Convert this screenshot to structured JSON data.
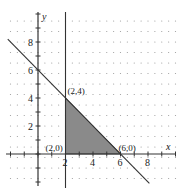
{
  "diagram": {
    "type": "feasible-region",
    "axes": {
      "x_label": "x",
      "y_label": "y",
      "x_ticks": [
        "2",
        "4",
        "6",
        "8"
      ],
      "y_ticks": [
        "2",
        "4",
        "6",
        "8"
      ]
    },
    "lines": [
      {
        "name": "x + y = 6",
        "from": [
          -2,
          8
        ],
        "to": [
          8,
          -2
        ]
      },
      {
        "name": "x = 2",
        "from": [
          2,
          -3
        ],
        "to": [
          2,
          10
        ]
      }
    ],
    "region": {
      "vertices": [
        [
          2,
          0
        ],
        [
          2,
          4
        ],
        [
          6,
          0
        ]
      ],
      "fill": "#8a8a8a"
    },
    "points": [
      {
        "label": "(2,4)",
        "x": 2,
        "y": 4
      },
      {
        "label": "(2,0)",
        "x": 2,
        "y": 0
      },
      {
        "label": "(6,0)",
        "x": 6,
        "y": 0
      }
    ],
    "colors": {
      "axis": "#333333",
      "line": "#333333",
      "dots": "#9a9a9a",
      "region": "#8a8a8a"
    }
  }
}
